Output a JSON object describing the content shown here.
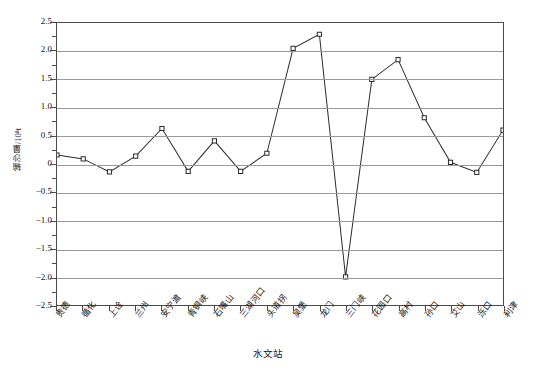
{
  "chart_data": {
    "type": "line",
    "title": "",
    "xlabel": "水文站",
    "ylabel": "输沙量/10⁸t",
    "ylim": [
      -2.5,
      2.5
    ],
    "ytick_step": 0.5,
    "minor_tick_step": 0.25,
    "grid": "horizontal",
    "legend": "none",
    "marker": "open-square",
    "line_color": "#2b2b2b",
    "grid_color": "#9a9a9a",
    "axis_color": "#4a4a4a",
    "categories": [
      "贵德",
      "循化",
      "上诠",
      "兰州",
      "安宁渡",
      "青铜峡",
      "石嘴山",
      "三湖河口",
      "头道拐",
      "吴堡",
      "龙门",
      "三门峡",
      "花园口",
      "高村",
      "孙口",
      "艾山",
      "泺口",
      "利津"
    ],
    "values": [
      0.16,
      0.09,
      -0.14,
      0.14,
      0.63,
      -0.13,
      0.41,
      -0.13,
      0.19,
      2.05,
      2.3,
      -2.0,
      1.5,
      1.85,
      0.82,
      0.03,
      -0.15,
      0.6
    ],
    "ytick_labels": [
      "2.5",
      "2.0",
      "1.5",
      "1.0",
      "0.5",
      "0",
      "−0.5",
      "−1.0",
      "−1.5",
      "−2.0",
      "−2.5"
    ],
    "ytick_values": [
      2.5,
      2.0,
      1.5,
      1.0,
      0.5,
      0,
      -0.5,
      -1.0,
      -1.5,
      -2.0,
      -2.5
    ]
  }
}
